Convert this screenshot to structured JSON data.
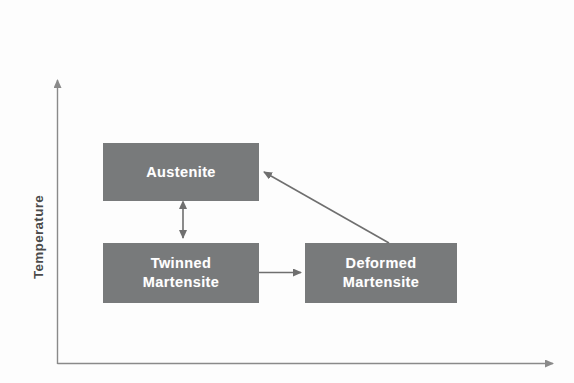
{
  "figure": {
    "type": "diagram",
    "background_color": "#fdfdfd",
    "box_fill_color": "#787a7b",
    "box_text_color": "#ffffff",
    "axis_color": "#8a8a8a",
    "arrow_color": "#6f6f6f"
  },
  "axes": {
    "y": {
      "label": "Temperature",
      "orientation": "vertical",
      "arrow_head": "up",
      "tick_labels": []
    },
    "x": {
      "label": "",
      "orientation": "horizontal",
      "arrow_head": "right",
      "tick_labels": []
    }
  },
  "nodes": [
    {
      "id": "austenite",
      "label": "Austenite",
      "lines": [
        "Austenite"
      ]
    },
    {
      "id": "twinned_martensite",
      "label": "Twinned Martensite",
      "lines": [
        "Twinned",
        "Martensite"
      ]
    },
    {
      "id": "deformed_martensite",
      "label": "Deformed Martensite",
      "lines": [
        "Deformed",
        "Martensite"
      ]
    }
  ],
  "edges": [
    {
      "id": "austenite-twinned",
      "from": "austenite",
      "to": "twinned_martensite",
      "label": "",
      "style": "double-headed-vertical"
    },
    {
      "id": "twinned-deformed",
      "from": "twinned_martensite",
      "to": "deformed_martensite",
      "label": "",
      "style": "single-headed-horizontal"
    },
    {
      "id": "deformed-austenite",
      "from": "deformed_martensite",
      "to": "austenite",
      "label": "",
      "style": "single-headed-diagonal"
    }
  ]
}
